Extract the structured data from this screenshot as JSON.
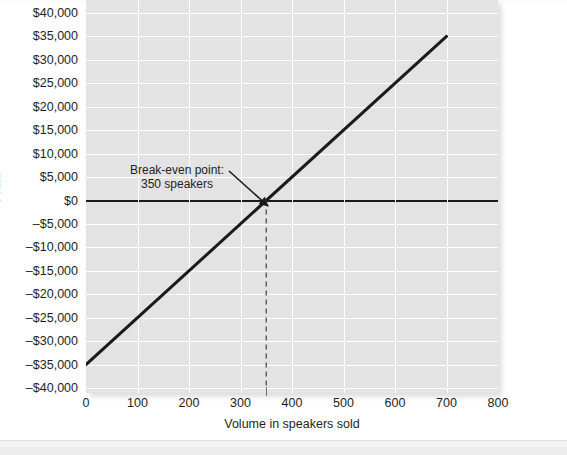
{
  "chart_data": {
    "type": "line",
    "title": "",
    "xlabel": "Volume in speakers sold",
    "ylabel": "Profit",
    "xlim": [
      0,
      800
    ],
    "ylim": [
      -40000,
      40000
    ],
    "grid": true,
    "legend": "none",
    "x_ticks": [
      "0",
      "100",
      "200",
      "300",
      "400",
      "500",
      "600",
      "700",
      "800"
    ],
    "x_tick_values": [
      0,
      100,
      200,
      300,
      400,
      500,
      600,
      700,
      800
    ],
    "y_ticks": [
      "$40,000",
      "$35,000",
      "$30,000",
      "$25,000",
      "$20,000",
      "$15,000",
      "$10,000",
      "$5,000",
      "$0",
      "–$5,000",
      "–$10,000",
      "–$15,000",
      "–$20,000",
      "–$25,000",
      "–$30,000",
      "–$35,000",
      "–$40,000"
    ],
    "y_tick_values": [
      40000,
      35000,
      30000,
      25000,
      20000,
      15000,
      10000,
      5000,
      0,
      -5000,
      -10000,
      -15000,
      -20000,
      -25000,
      -30000,
      -35000,
      -40000
    ],
    "series": [
      {
        "name": "Profit",
        "type": "line",
        "color": "#1b1b1b",
        "width": 3,
        "x": [
          0,
          700
        ],
        "values": [
          -35000,
          35000
        ],
        "points": [
          [
            0,
            -35000
          ],
          [
            100,
            -25000
          ],
          [
            200,
            -15000
          ],
          [
            300,
            -5000
          ],
          [
            350,
            0
          ],
          [
            400,
            5000
          ],
          [
            500,
            15000
          ],
          [
            600,
            25000
          ],
          [
            700,
            35000
          ]
        ]
      },
      {
        "name": "Zero profit line",
        "type": "hline",
        "color": "#1b1b1b",
        "width": 2,
        "y": 0
      },
      {
        "name": "Break-even volume marker",
        "type": "vline-dashed",
        "color": "#4d4d4d",
        "x": 350,
        "y_from": 0,
        "y_to": -40000
      }
    ],
    "annotations": [
      {
        "name": "break-even-annotation",
        "lines": [
          "Break-even point:",
          "350 speakers"
        ],
        "point_x": 350,
        "point_y": 0,
        "arrow": true
      }
    ],
    "colors": {
      "plot_background": "#e3e3e3",
      "gridline": "#ffffff",
      "line": "#1b1b1b",
      "text": "#231f20",
      "page_background": "#ffffff"
    }
  }
}
